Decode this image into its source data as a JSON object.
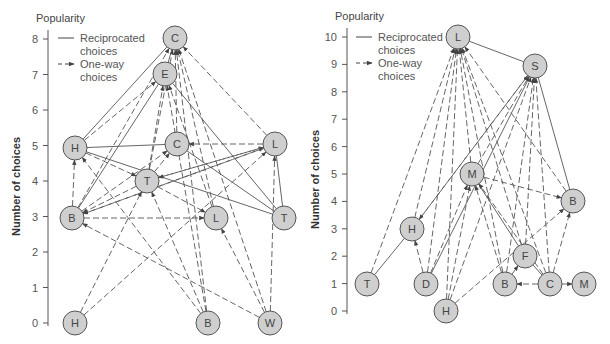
{
  "charts": [
    {
      "id": "left",
      "axis_title": "Popularity",
      "ylabel": "Number of choices",
      "axis": {
        "x": 48,
        "y0": 323,
        "unit": 35.5,
        "min": 0,
        "max": 8,
        "top": 30
      },
      "ticks": [
        "0",
        "1",
        "2",
        "3",
        "4",
        "5",
        "6",
        "7",
        "8"
      ],
      "legend": {
        "x": 58,
        "y": 38,
        "reciprocated": [
          "Reciprocated",
          "choices"
        ],
        "oneway": [
          "One-way",
          "choices"
        ]
      },
      "nodes": [
        {
          "id": "C1",
          "label": "C",
          "x": 175,
          "y": 38
        },
        {
          "id": "E",
          "label": "E",
          "x": 165,
          "y": 74
        },
        {
          "id": "H1",
          "label": "H",
          "x": 75,
          "y": 148
        },
        {
          "id": "C2",
          "label": "C",
          "x": 177,
          "y": 144
        },
        {
          "id": "L1",
          "label": "L",
          "x": 275,
          "y": 144
        },
        {
          "id": "T1",
          "label": "T",
          "x": 147,
          "y": 181
        },
        {
          "id": "B1",
          "label": "B",
          "x": 72,
          "y": 218
        },
        {
          "id": "L2",
          "label": "L",
          "x": 216,
          "y": 218
        },
        {
          "id": "T2",
          "label": "T",
          "x": 284,
          "y": 218
        },
        {
          "id": "H2",
          "label": "H",
          "x": 75,
          "y": 323
        },
        {
          "id": "B2",
          "label": "B",
          "x": 208,
          "y": 323
        },
        {
          "id": "W",
          "label": "W",
          "x": 270,
          "y": 323
        }
      ],
      "edges": [
        {
          "from": "H1",
          "to": "C1",
          "type": "recip"
        },
        {
          "from": "E",
          "to": "C1",
          "type": "recip"
        },
        {
          "from": "E",
          "to": "T2",
          "type": "recip"
        },
        {
          "from": "H1",
          "to": "C2",
          "type": "recip"
        },
        {
          "from": "H1",
          "to": "T2",
          "type": "recip"
        },
        {
          "from": "C2",
          "to": "T2",
          "type": "recip"
        },
        {
          "from": "L1",
          "to": "T2",
          "type": "recip"
        },
        {
          "from": "B1",
          "to": "E",
          "type": "recip"
        },
        {
          "from": "B1",
          "to": "C1",
          "type": "oneway"
        },
        {
          "from": "H1",
          "to": "E",
          "type": "oneway"
        },
        {
          "from": "T1",
          "to": "C1",
          "type": "oneway"
        },
        {
          "from": "L2",
          "to": "C1",
          "type": "oneway"
        },
        {
          "from": "B2",
          "to": "C1",
          "type": "oneway"
        },
        {
          "from": "W",
          "to": "C1",
          "type": "oneway"
        },
        {
          "from": "L1",
          "to": "C1",
          "type": "oneway"
        },
        {
          "from": "C2",
          "to": "C1",
          "type": "oneway"
        },
        {
          "from": "T1",
          "to": "E",
          "type": "oneway"
        },
        {
          "from": "L2",
          "to": "E",
          "type": "oneway"
        },
        {
          "from": "B2",
          "to": "E",
          "type": "oneway"
        },
        {
          "from": "L1",
          "to": "C2",
          "type": "oneway"
        },
        {
          "from": "T1",
          "to": "C2",
          "type": "oneway"
        },
        {
          "from": "B1",
          "to": "C2",
          "type": "oneway"
        },
        {
          "from": "B1",
          "to": "L1",
          "type": "oneway"
        },
        {
          "from": "T1",
          "to": "L1",
          "type": "oneway"
        },
        {
          "from": "H2",
          "to": "L1",
          "type": "oneway"
        },
        {
          "from": "H1",
          "to": "T1",
          "type": "oneway"
        },
        {
          "from": "L1",
          "to": "T1",
          "type": "oneway"
        },
        {
          "from": "B1",
          "to": "H1",
          "type": "oneway"
        },
        {
          "from": "T1",
          "to": "B1",
          "type": "oneway"
        },
        {
          "from": "L1",
          "to": "B1",
          "type": "oneway"
        },
        {
          "from": "B1",
          "to": "L2",
          "type": "oneway"
        },
        {
          "from": "T1",
          "to": "L2",
          "type": "oneway"
        },
        {
          "from": "H2",
          "to": "T1",
          "type": "oneway"
        },
        {
          "from": "B2",
          "to": "T1",
          "type": "oneway"
        },
        {
          "from": "B2",
          "to": "H1",
          "type": "oneway"
        },
        {
          "from": "W",
          "to": "B1",
          "type": "oneway"
        },
        {
          "from": "W",
          "to": "L2",
          "type": "oneway"
        },
        {
          "from": "W",
          "to": "L1",
          "type": "oneway"
        }
      ]
    },
    {
      "id": "right",
      "axis_title": "Popularity",
      "ylabel": "Number of choices",
      "axis": {
        "x": 347,
        "y0": 311,
        "unit": 27.4,
        "min": 0,
        "max": 10,
        "top": 28
      },
      "ticks": [
        "0",
        "1",
        "2",
        "3",
        "4",
        "5",
        "6",
        "7",
        "8",
        "9",
        "10"
      ],
      "legend": {
        "x": 356,
        "y": 37,
        "reciprocated": [
          "Reciprocated",
          "choices"
        ],
        "oneway": [
          "One-way",
          "choices"
        ]
      },
      "nodes": [
        {
          "id": "L",
          "label": "L",
          "x": 458,
          "y": 37
        },
        {
          "id": "S",
          "label": "S",
          "x": 535,
          "y": 66
        },
        {
          "id": "M1",
          "label": "M",
          "x": 472,
          "y": 174
        },
        {
          "id": "B1",
          "label": "B",
          "x": 573,
          "y": 201
        },
        {
          "id": "H1",
          "label": "H",
          "x": 412,
          "y": 229
        },
        {
          "id": "F",
          "label": "F",
          "x": 525,
          "y": 256
        },
        {
          "id": "T",
          "label": "T",
          "x": 367,
          "y": 284
        },
        {
          "id": "D",
          "label": "D",
          "x": 426,
          "y": 284
        },
        {
          "id": "B2",
          "label": "B",
          "x": 505,
          "y": 284
        },
        {
          "id": "C",
          "label": "C",
          "x": 550,
          "y": 284
        },
        {
          "id": "M2",
          "label": "M",
          "x": 584,
          "y": 284
        },
        {
          "id": "H2",
          "label": "H",
          "x": 446,
          "y": 311
        }
      ],
      "edges": [
        {
          "from": "L",
          "to": "S",
          "type": "recip"
        },
        {
          "from": "S",
          "to": "B1",
          "type": "recip"
        },
        {
          "from": "T",
          "to": "H1",
          "type": "recip"
        },
        {
          "from": "D",
          "to": "S",
          "type": "recip"
        },
        {
          "from": "F",
          "to": "C",
          "type": "recip"
        },
        {
          "from": "M1",
          "to": "F",
          "type": "recip"
        },
        {
          "from": "T",
          "to": "L",
          "type": "oneway"
        },
        {
          "from": "H1",
          "to": "L",
          "type": "oneway"
        },
        {
          "from": "D",
          "to": "L",
          "type": "oneway"
        },
        {
          "from": "H2",
          "to": "L",
          "type": "oneway"
        },
        {
          "from": "M1",
          "to": "L",
          "type": "oneway"
        },
        {
          "from": "B2",
          "to": "L",
          "type": "oneway"
        },
        {
          "from": "F",
          "to": "L",
          "type": "oneway"
        },
        {
          "from": "C",
          "to": "L",
          "type": "oneway"
        },
        {
          "from": "B1",
          "to": "L",
          "type": "oneway"
        },
        {
          "from": "H2",
          "to": "S",
          "type": "oneway"
        },
        {
          "from": "B2",
          "to": "S",
          "type": "oneway"
        },
        {
          "from": "C",
          "to": "S",
          "type": "oneway"
        },
        {
          "from": "F",
          "to": "S",
          "type": "oneway"
        },
        {
          "from": "M1",
          "to": "S",
          "type": "oneway"
        },
        {
          "from": "H1",
          "to": "S",
          "type": "oneway"
        },
        {
          "from": "M1",
          "to": "B1",
          "type": "oneway"
        },
        {
          "from": "S",
          "to": "H1",
          "type": "oneway"
        },
        {
          "from": "D",
          "to": "H1",
          "type": "oneway"
        },
        {
          "from": "H2",
          "to": "M1",
          "type": "oneway"
        },
        {
          "from": "D",
          "to": "M1",
          "type": "oneway"
        },
        {
          "from": "B2",
          "to": "M1",
          "type": "oneway"
        },
        {
          "from": "C",
          "to": "M1",
          "type": "oneway"
        },
        {
          "from": "B2",
          "to": "F",
          "type": "oneway"
        },
        {
          "from": "C",
          "to": "B2",
          "type": "oneway"
        },
        {
          "from": "C",
          "to": "M2",
          "type": "oneway"
        },
        {
          "from": "C",
          "to": "B1",
          "type": "oneway"
        },
        {
          "from": "H2",
          "to": "B1",
          "type": "oneway"
        }
      ]
    }
  ]
}
